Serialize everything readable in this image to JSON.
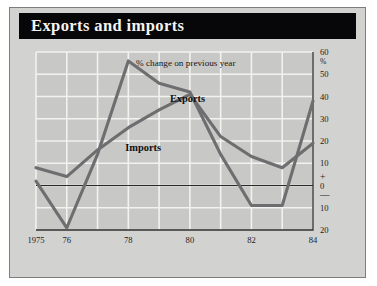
{
  "panel": {
    "title": "Exports and imports",
    "background_color": "#d2d2d0",
    "title_bar_color": "#07070a",
    "title_text_color": "#f4f4f2"
  },
  "chart_data": {
    "type": "line",
    "title": "Exports and imports",
    "annotation": "% change on previous year",
    "xlabel": "",
    "ylabel": "%",
    "unit_label": "%",
    "grid": true,
    "legend": "inline-labels",
    "legend_position": "inline",
    "x": [
      1975,
      1976,
      1977,
      1978,
      1979,
      1980,
      1981,
      1982,
      1983,
      1984
    ],
    "xtick_values": [
      1975,
      1976,
      1978,
      1980,
      1982,
      1984
    ],
    "xtick_labels": [
      "1975",
      "76",
      "78",
      "80",
      "82",
      "84"
    ],
    "xlim": [
      1975,
      1984
    ],
    "ylim": [
      -20,
      60
    ],
    "ytick_values": [
      60,
      50,
      40,
      30,
      20,
      10,
      0,
      -10,
      -20
    ],
    "ytick_labels": [
      "60",
      "50",
      "40",
      "30",
      "20",
      "10",
      "0",
      "10",
      "20"
    ],
    "y_sign_plus": "+",
    "y_sign_minus": "—",
    "zero_line": 0,
    "line_color": "#6e6e70",
    "plot_bg_color": "#c8c8c6",
    "grid_color": "#f2f2f0",
    "axis_color": "#2a2a2a",
    "series": [
      {
        "name": "Exports",
        "label": "Exports",
        "label_x": 1979.35,
        "label_y": 37.5,
        "values": [
          2,
          -19,
          14,
          56,
          46,
          42,
          14,
          -9,
          -9,
          38
        ]
      },
      {
        "name": "Imports",
        "label": "Imports",
        "label_x": 1977.9,
        "label_y": 15.5,
        "values": [
          8,
          4,
          16,
          26,
          34,
          41,
          22,
          13,
          8,
          19
        ]
      }
    ]
  }
}
